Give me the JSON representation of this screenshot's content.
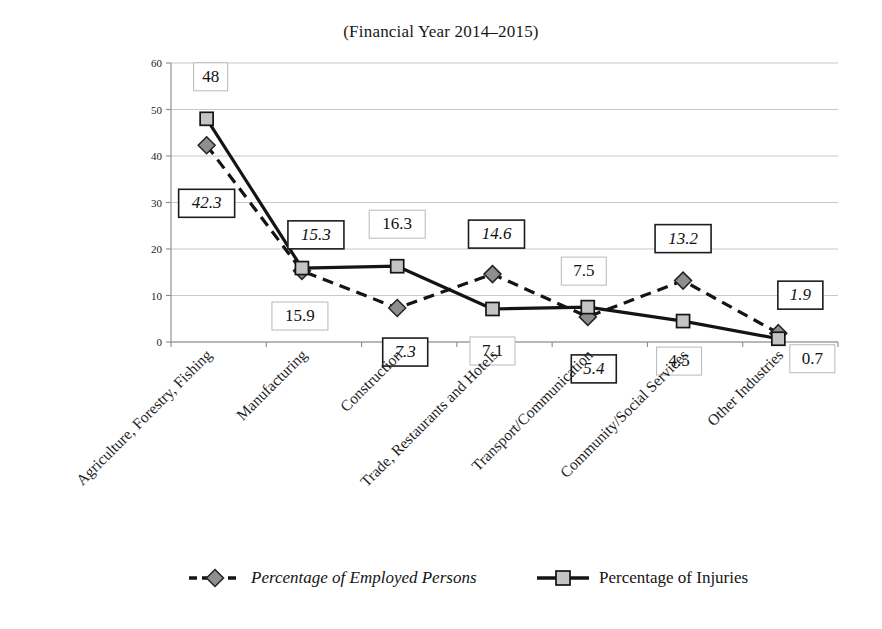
{
  "chart_data": {
    "type": "line",
    "title": "(Financial Year 2014–2015)",
    "xlabel": "",
    "ylabel": "",
    "ylim": [
      0,
      60
    ],
    "yticks": [
      0,
      10,
      20,
      30,
      40,
      50,
      60
    ],
    "ytick_labels": [
      "0",
      "10",
      "20",
      "30",
      "40",
      "50",
      "60"
    ],
    "grid": true,
    "legend_position": "bottom",
    "categories": [
      "Agriculture, Forestry, Fishing",
      "Manufacturing",
      "Construction",
      "Trade, Restaurants and Hotels",
      "Transport/Communication",
      "Community/Social Services",
      "Other Industries"
    ],
    "series": [
      {
        "name": "Percentage of Employed Persons",
        "style": "dashed",
        "marker": "diamond",
        "label_style": "italic",
        "values": [
          42.3,
          15.3,
          7.3,
          14.6,
          5.4,
          13.2,
          1.9
        ],
        "value_labels": [
          "42.3",
          "15.3",
          "7.3",
          "14.6",
          "5.4",
          "13.2",
          "1.9"
        ]
      },
      {
        "name": "Percentage of Injuries",
        "style": "solid",
        "marker": "square",
        "label_style": "normal",
        "values": [
          48,
          15.9,
          16.3,
          7.1,
          7.5,
          4.5,
          0.7
        ],
        "value_labels": [
          "48",
          "15.9",
          "16.3",
          "7.1",
          "7.5",
          "4.5",
          "0.7"
        ]
      }
    ]
  },
  "legend": {
    "items": [
      {
        "label": "Percentage of Employed Persons",
        "style": "dashed",
        "marker": "diamond"
      },
      {
        "label": "Percentage of Injuries",
        "style": "solid",
        "marker": "square"
      }
    ]
  },
  "colors": {
    "line": "#141414",
    "square_marker_fill": "#c4c4c4",
    "diamond_marker_fill": "#8e8e8e",
    "gridline": "#c9c9c9",
    "background": "#ffffff"
  }
}
